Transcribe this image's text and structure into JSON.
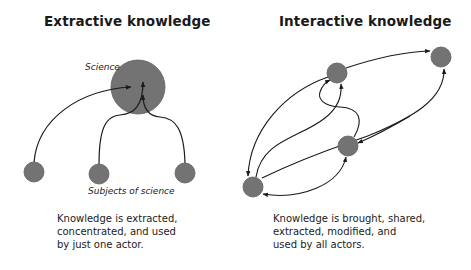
{
  "colors": {
    "node_fill": "#737373",
    "node_stroke": "#5e5e5e",
    "edge": "#1a1a1a",
    "text": "#1a1a1a",
    "background": "#ffffff"
  },
  "extractive": {
    "title": "Extractive knowledge",
    "center_label": "Science",
    "subjects_label": "Subjects of science",
    "caption": [
      "Knowledge is extracted,",
      "concentrated, and used",
      "by just one actor."
    ],
    "nodes": [
      {
        "id": "science",
        "x": 138,
        "y": 87,
        "r": 27
      },
      {
        "id": "subject-1",
        "x": 34,
        "y": 172,
        "r": 10
      },
      {
        "id": "subject-2",
        "x": 99,
        "y": 174,
        "r": 10
      },
      {
        "id": "subject-3",
        "x": 185,
        "y": 173,
        "r": 10
      }
    ],
    "edges": [
      {
        "from": "subject-1",
        "to": "science"
      },
      {
        "from": "subject-2",
        "to": "science"
      },
      {
        "from": "subject-3",
        "to": "science"
      }
    ]
  },
  "interactive": {
    "title": "Interactive knowledge",
    "caption": [
      "Knowledge is brought, shared,",
      "extracted, modified, and",
      "used by all actors."
    ],
    "nodes": [
      {
        "id": "actor-a",
        "x": 337,
        "y": 73,
        "r": 10
      },
      {
        "id": "actor-b",
        "x": 441,
        "y": 57,
        "r": 10
      },
      {
        "id": "actor-c",
        "x": 348,
        "y": 146,
        "r": 10
      },
      {
        "id": "actor-d",
        "x": 253,
        "y": 187,
        "r": 10
      }
    ],
    "edges": [
      {
        "from": "actor-a",
        "to": "actor-b"
      },
      {
        "from": "actor-d",
        "to": "actor-b"
      },
      {
        "from": "actor-d",
        "to": "actor-a"
      },
      {
        "from": "actor-a",
        "to": "actor-d"
      },
      {
        "from": "actor-c",
        "to": "actor-a"
      },
      {
        "from": "actor-a",
        "to": "actor-c"
      },
      {
        "from": "actor-c",
        "to": "actor-d"
      },
      {
        "from": "actor-d",
        "to": "actor-c"
      }
    ]
  }
}
